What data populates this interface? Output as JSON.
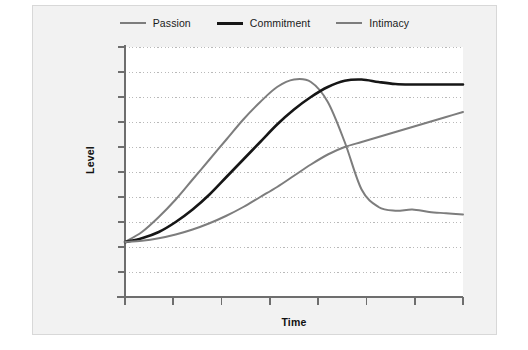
{
  "figure": {
    "background_color": "#f2f2f2",
    "border_color": "#d8d8d8",
    "plot_background_color": "#ffffff"
  },
  "chart_data": {
    "type": "line",
    "title": "",
    "subtitle": "",
    "xlabel": "Time",
    "ylabel": "Level",
    "grid": true,
    "grid_style": "dotted-horizontal",
    "grid_color": "#b9b9b9",
    "legend_position": "top-center",
    "axis_color": "#6e6e6e",
    "xlim": [
      0,
      10
    ],
    "ylim": [
      0,
      10
    ],
    "x_tick_count": 7,
    "y_tick_count": 10,
    "x_tick_labels": [],
    "y_tick_labels": [],
    "x": [
      0,
      0.5,
      1,
      1.5,
      2,
      2.5,
      3,
      3.5,
      4,
      4.5,
      5,
      5.5,
      6,
      6.5,
      7,
      7.5,
      8,
      8.5,
      9,
      9.5,
      10
    ],
    "series": [
      {
        "name": "Passion",
        "color": "#7d7d7d",
        "width": 2.0,
        "values": [
          2.2,
          2.6,
          3.2,
          3.9,
          4.7,
          5.5,
          6.3,
          7.1,
          7.8,
          8.4,
          8.7,
          8.6,
          7.8,
          6.2,
          4.3,
          3.6,
          3.45,
          3.5,
          3.4,
          3.35,
          3.3
        ]
      },
      {
        "name": "Commitment",
        "color": "#161616",
        "width": 2.6,
        "values": [
          2.2,
          2.35,
          2.6,
          3.0,
          3.5,
          4.1,
          4.8,
          5.5,
          6.2,
          6.9,
          7.5,
          8.0,
          8.4,
          8.65,
          8.7,
          8.6,
          8.52,
          8.5,
          8.5,
          8.5,
          8.5
        ]
      },
      {
        "name": "Intimacy",
        "color": "#7d7d7d",
        "width": 2.0,
        "values": [
          2.2,
          2.25,
          2.35,
          2.5,
          2.7,
          2.95,
          3.25,
          3.6,
          4.0,
          4.4,
          4.85,
          5.3,
          5.7,
          6.0,
          6.2,
          6.4,
          6.6,
          6.8,
          7.0,
          7.2,
          7.4
        ]
      }
    ],
    "annotations": []
  },
  "legend": {
    "items": [
      {
        "label": "Passion",
        "color": "#7d7d7d",
        "width": 2
      },
      {
        "label": "Commitment",
        "color": "#161616",
        "width": 3
      },
      {
        "label": "Intimacy",
        "color": "#7d7d7d",
        "width": 2
      }
    ]
  },
  "axes": {
    "x_title": "Time",
    "y_title": "Level"
  }
}
